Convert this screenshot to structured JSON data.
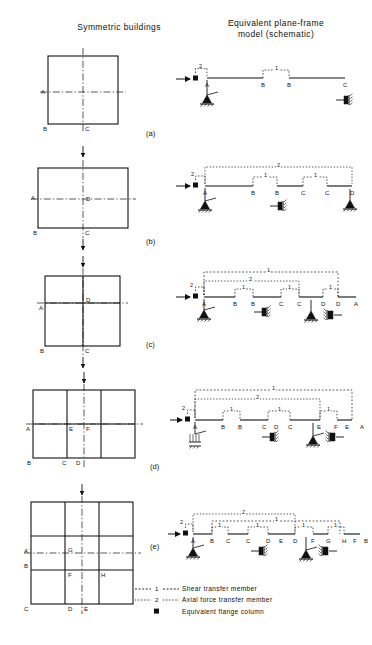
{
  "figure": {
    "headers": {
      "left": "Symmetric  buildings",
      "right_line1": "Equivalent  plane-frame",
      "right_line2": "model   (schematic)"
    },
    "legend": [
      {
        "key": "----1----",
        "key_type": "shear-dash",
        "label": "Shear  transfer  member"
      },
      {
        "key": "----2----",
        "key_type": "axial-dot",
        "label": "Axial force  transfer member"
      },
      {
        "key": "■",
        "key_type": "flange-square",
        "label": "Equivalent  flange  column"
      }
    ],
    "panels": [
      {
        "id": "a",
        "letter": "(a)",
        "building": {
          "labels": [
            {
              "text": "A",
              "x": 6,
              "y": 50
            },
            {
              "text": "B",
              "x": 6,
              "y": 90
            },
            {
              "text": "C",
              "x": 52,
              "y": 90
            }
          ]
        },
        "frame": {
          "node_labels": [
            "A",
            "B",
            "B",
            "C"
          ],
          "link_labels": [
            "2",
            "1"
          ],
          "supports": [
            "pin",
            "roller"
          ]
        }
      },
      {
        "id": "b",
        "letter": "(b)",
        "building": {
          "labels": [
            {
              "text": "A",
              "x": 2,
              "y": 44
            },
            {
              "text": "B",
              "x": 4,
              "y": 84
            },
            {
              "text": "C",
              "x": 52,
              "y": 84
            },
            {
              "text": "D",
              "x": 56,
              "y": 48
            }
          ]
        },
        "frame": {
          "node_labels": [
            "A",
            "B",
            "B",
            "C",
            "C",
            "D"
          ],
          "link_labels": [
            "2",
            "1",
            "1",
            "2"
          ],
          "supports": [
            "pin",
            "roller",
            "pin"
          ]
        }
      },
      {
        "id": "c",
        "letter": "(c)",
        "building": {
          "labels": [
            {
              "text": "A",
              "x": 3,
              "y": 46
            },
            {
              "text": "B",
              "x": 3,
              "y": 86
            },
            {
              "text": "C",
              "x": 52,
              "y": 86
            },
            {
              "text": "D",
              "x": 55,
              "y": 44
            }
          ]
        },
        "frame": {
          "node_labels": [
            "A",
            "B",
            "B",
            "C",
            "C",
            "D",
            "D",
            "A"
          ],
          "link_labels": [
            "2",
            "1",
            "1",
            "1",
            "1",
            "2"
          ],
          "supports": [
            "pin",
            "roller",
            "pin",
            "roller"
          ]
        }
      },
      {
        "id": "d",
        "letter": "(d)",
        "building": {
          "labels": [
            {
              "text": "A",
              "x": 2,
              "y": 46
            },
            {
              "text": "B",
              "x": 3,
              "y": 88
            },
            {
              "text": "C",
              "x": 39,
              "y": 88
            },
            {
              "text": "D",
              "x": 53,
              "y": 88
            },
            {
              "text": "E",
              "x": 40,
              "y": 48
            },
            {
              "text": "F",
              "x": 56,
              "y": 48
            }
          ]
        },
        "frame": {
          "node_labels": [
            "A",
            "B",
            "B",
            "C",
            "D",
            "C",
            "E",
            "F",
            "E",
            "A"
          ],
          "link_labels": [
            "2",
            "1",
            "1",
            "1",
            "2",
            "1"
          ],
          "supports": [
            "fixed",
            "roller",
            "pin",
            "roller"
          ]
        }
      },
      {
        "id": "e",
        "letter": "(e)",
        "building": {
          "labels": [
            {
              "text": "A",
              "x": 2,
              "y": 56
            },
            {
              "text": "B",
              "x": 2,
              "y": 74
            },
            {
              "text": "C",
              "x": 2,
              "y": 112
            },
            {
              "text": "D",
              "x": 40,
              "y": 112
            },
            {
              "text": "E",
              "x": 54,
              "y": 112
            },
            {
              "text": "F",
              "x": 40,
              "y": 78
            },
            {
              "text": "G",
              "x": 40,
              "y": 58
            },
            {
              "text": "H",
              "x": 56,
              "y": 78
            }
          ]
        },
        "frame": {
          "node_labels": [
            "A",
            "B",
            "C",
            "C",
            "D",
            "E",
            "D",
            "F",
            "G",
            "H",
            "F",
            "B"
          ],
          "link_labels": [
            "2",
            "2",
            "1",
            "1",
            "1",
            "1",
            "1"
          ],
          "supports": [
            "pin",
            "roller",
            "pin",
            "roller"
          ]
        }
      }
    ]
  }
}
